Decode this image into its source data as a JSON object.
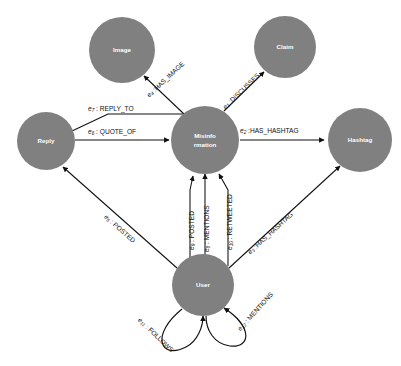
{
  "diagram": {
    "type": "directed-graph",
    "background_color": "#ffffff",
    "node_fill_color": "#808080",
    "node_label_color": "#ffffff",
    "edge_color": "#101010",
    "edge_label_color": "#111111",
    "nodes": [
      {
        "id": "image",
        "label": "Image",
        "label_line2": "",
        "cx": 122,
        "cy": 50,
        "r": 33
      },
      {
        "id": "claim",
        "label": "Claim",
        "label_line2": "",
        "cx": 285,
        "cy": 47,
        "r": 31
      },
      {
        "id": "reply",
        "label": "Reply",
        "label_line2": "",
        "cx": 46,
        "cy": 141,
        "r": 29
      },
      {
        "id": "misinformation",
        "label": "Misinfo",
        "label_line2": "rmation",
        "cx": 205,
        "cy": 140,
        "r": 34
      },
      {
        "id": "hashtag",
        "label": "Hashtag",
        "label_line2": "",
        "cx": 360,
        "cy": 140,
        "r": 32
      },
      {
        "id": "user",
        "label": "User",
        "label_line2": "",
        "cx": 203,
        "cy": 285,
        "r": 31
      }
    ],
    "edges": [
      {
        "id": "e1",
        "var": "e",
        "sub": "1",
        "sep": " :",
        "label": "DISCUSSES",
        "from": "misinformation",
        "to": "claim",
        "kind": "diagonal"
      },
      {
        "id": "e2",
        "var": "e",
        "sub": "2",
        "sep": " :",
        "label": "HAS_HASHTAG",
        "from": "misinformation",
        "to": "hashtag",
        "kind": "horizontal"
      },
      {
        "id": "e3",
        "var": "e",
        "sub": "3",
        "sep": " :",
        "label": "HAS_HASHTAG",
        "from": "user",
        "to": "hashtag",
        "kind": "diagonal"
      },
      {
        "id": "e4",
        "var": "e",
        "sub": "4",
        "sep": " :",
        "label": "HAS_IMAGE",
        "from": "misinformation",
        "to": "image",
        "kind": "diagonal"
      },
      {
        "id": "e5",
        "var": "e",
        "sub": "5",
        "sep": " : ",
        "label": "POSTED",
        "from": "user",
        "to": "reply",
        "kind": "diagonal"
      },
      {
        "id": "e6",
        "var": "e",
        "sub": "6",
        "sep": " : ",
        "label": "QUOTE_OF",
        "from": "reply",
        "to": "misinformation",
        "kind": "horizontal"
      },
      {
        "id": "e7",
        "var": "e",
        "sub": "7",
        "sep": " : ",
        "label": "REPLY_TO",
        "from": "reply",
        "to": "misinformation",
        "kind": "horizontal"
      },
      {
        "id": "e8",
        "var": "e",
        "sub": "8",
        "sep": " : ",
        "label": "MENTIONS",
        "from": "user",
        "to": "misinformation",
        "kind": "vertical"
      },
      {
        "id": "e9",
        "var": "e",
        "sub": "9",
        "sep": " : ",
        "label": "POSTED",
        "from": "user",
        "to": "misinformation",
        "kind": "vertical"
      },
      {
        "id": "e10",
        "var": "e",
        "sub": "10",
        "sep": " : ",
        "label": "RETWEETED",
        "from": "user",
        "to": "misinformation",
        "kind": "vertical"
      },
      {
        "id": "e11",
        "var": "e",
        "sub": "11",
        "sep": " : ",
        "label": "FOLLOWS",
        "from": "user",
        "to": "user",
        "kind": "self-loop"
      },
      {
        "id": "e12",
        "var": "e",
        "sub": "12",
        "sep": " : ",
        "label": "MENTIONS",
        "from": "user",
        "to": "user",
        "kind": "self-loop"
      }
    ]
  }
}
